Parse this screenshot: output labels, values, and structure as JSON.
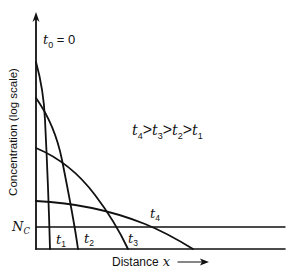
{
  "diagram": {
    "type": "impurity-diffusion-profiles",
    "y_axis_label": "Concentration (log scale)",
    "x_axis_label": "Distance",
    "x_axis_var": "x",
    "initial_label": {
      "var": "t",
      "sub": "0",
      "rest": " = 0"
    },
    "threshold_label": {
      "var": "N",
      "sub": "C"
    },
    "relation": [
      {
        "var": "t",
        "sub": "4"
      },
      {
        "op": ">"
      },
      {
        "var": "t",
        "sub": "3"
      },
      {
        "op": ">"
      },
      {
        "var": "t",
        "sub": "2"
      },
      {
        "op": ">"
      },
      {
        "var": "t",
        "sub": "1"
      }
    ],
    "curves": [
      {
        "name": "t1",
        "label_var": "t",
        "label_sub": "1"
      },
      {
        "name": "t2",
        "label_var": "t",
        "label_sub": "2"
      },
      {
        "name": "t3",
        "label_var": "t",
        "label_sub": "3"
      },
      {
        "name": "t4",
        "label_var": "t",
        "label_sub": "4"
      }
    ]
  }
}
